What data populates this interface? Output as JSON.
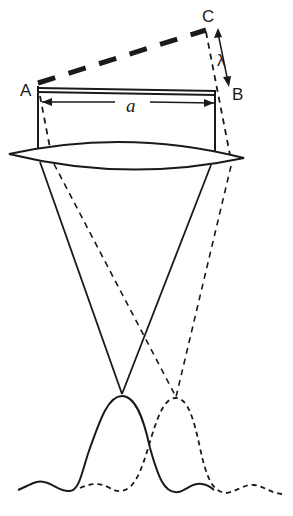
{
  "diagram": {
    "labels": {
      "point_a": "A",
      "point_b": "B",
      "point_c": "C",
      "aperture": "a",
      "wavelength": "λ"
    },
    "colors": {
      "ink": "#1a1a1a",
      "background": "#ffffff"
    },
    "elements": [
      "wavefront-dashed-AC",
      "aperture-bar-AB",
      "aperture-dimension-arrow",
      "wavelength-arrow-CB",
      "lens",
      "solid-ray-cone",
      "dashed-ray-cone",
      "solid-diffraction-pattern",
      "dashed-diffraction-pattern"
    ]
  }
}
